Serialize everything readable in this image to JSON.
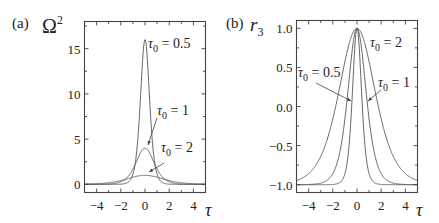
{
  "chart_data": [
    {
      "type": "line",
      "panel_label": "(a)",
      "ylabel": "Ω",
      "ylabel_sup": "2",
      "xlabel": "τ",
      "xlim": [
        -5,
        5
      ],
      "ylim": [
        -0.9,
        18
      ],
      "xticks": [
        -4,
        -2,
        0,
        2,
        4
      ],
      "xtick_labels": [
        "−4",
        "−2",
        "0",
        "2",
        "4"
      ],
      "yticks": [
        0,
        5,
        10,
        15
      ],
      "ytick_labels": [
        "0",
        "5",
        "10",
        "15"
      ],
      "grid": false,
      "formula": "Ω² = (4/τ0²)·sech²(τ/τ0)",
      "series": [
        {
          "name": "τ0 = 0.5",
          "tau0": 0.5,
          "peak": 16
        },
        {
          "name": "τ0 = 1",
          "tau0": 1,
          "peak": 4
        },
        {
          "name": "τ0 = 2",
          "tau0": 2,
          "peak": 1
        }
      ],
      "annotations": [
        {
          "text": "τ",
          "sub": "0",
          "rest": " = 0.5",
          "series": "τ0 = 0.5",
          "arrow": false
        },
        {
          "text": "τ",
          "sub": "0",
          "rest": " = 1",
          "series": "τ0 = 1",
          "arrow": true
        },
        {
          "text": "τ",
          "sub": "0",
          "rest": " = 2",
          "series": "τ0 = 2",
          "arrow": true
        }
      ]
    },
    {
      "type": "line",
      "panel_label": "(b)",
      "ylabel": "r",
      "ylabel_sub": "3",
      "xlabel": "τ",
      "xlim": [
        -5,
        5
      ],
      "ylim": [
        -1.1,
        1.1
      ],
      "xticks": [
        -4,
        -2,
        0,
        2,
        4
      ],
      "xtick_labels": [
        "−4",
        "−2",
        "0",
        "2",
        "4"
      ],
      "yticks": [
        1.0,
        0.5,
        0.0,
        -0.5,
        -1.0
      ],
      "ytick_labels": [
        "1.0",
        "0.5",
        "0.0",
        "−0.5",
        "−1.0"
      ],
      "grid": false,
      "formula": "r3 = −1 + 2·sech²(τ/τ0)",
      "series": [
        {
          "name": "τ0 = 0.5",
          "tau0": 0.5,
          "peak": 1.0
        },
        {
          "name": "τ0 = 1",
          "tau0": 1,
          "peak": 1.0
        },
        {
          "name": "τ0 = 2",
          "tau0": 2,
          "peak": 1.0
        }
      ],
      "annotations": [
        {
          "text": "τ",
          "sub": "0",
          "rest": " = 2",
          "series": "τ0 = 2",
          "arrow": false
        },
        {
          "text": "τ",
          "sub": "0",
          "rest": " = 0.5",
          "series": "τ0 = 0.5",
          "arrow": true
        },
        {
          "text": "τ",
          "sub": "0",
          "rest": " = 1",
          "series": "τ0 = 1",
          "arrow": true
        }
      ]
    }
  ]
}
